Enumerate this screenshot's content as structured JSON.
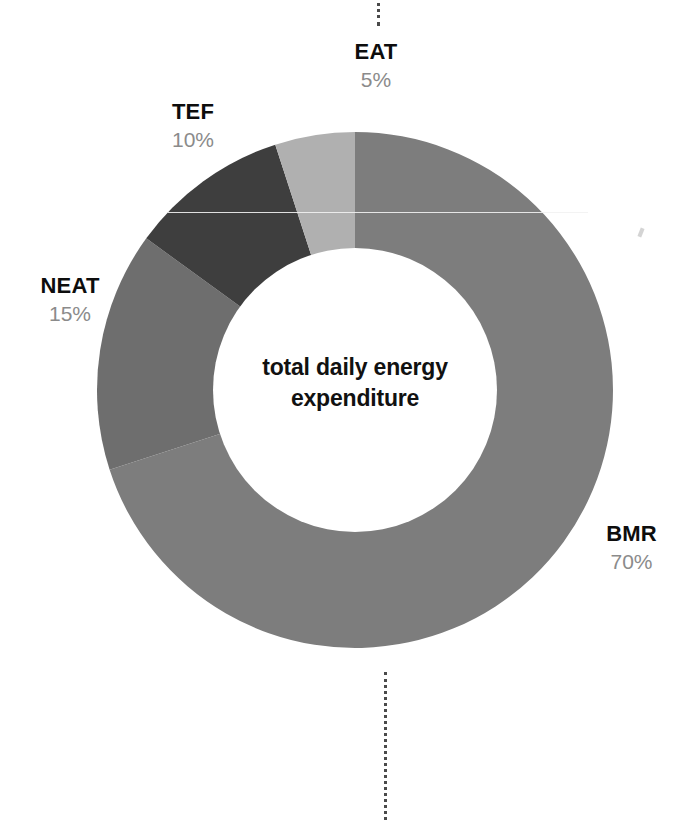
{
  "figure": {
    "center_caption_line1": "total daily energy",
    "center_caption_line2": "expenditure",
    "background_color": "#ffffff"
  },
  "labels": {
    "eat": {
      "name": "EAT",
      "pct": "5%"
    },
    "tef": {
      "name": "TEF",
      "pct": "10%"
    },
    "neat": {
      "name": "NEAT",
      "pct": "15%"
    },
    "bmr": {
      "name": "BMR",
      "pct": "70%"
    }
  },
  "connectors": {
    "top_icon": "vertical-dotted-line",
    "bottom_icon": "vertical-dotted-line"
  },
  "chart_data": {
    "type": "pie",
    "variant": "donut",
    "title": "total daily energy expenditure",
    "xlabel": "",
    "ylabel": "",
    "legend": "slice-callouts",
    "grid": false,
    "units": "percent",
    "total": 100,
    "start_angle_deg": 0,
    "direction": "clockwise",
    "inner_radius_ratio": 0.55,
    "categories": [
      "BMR",
      "NEAT",
      "TEF",
      "EAT"
    ],
    "values": [
      70,
      15,
      10,
      5
    ],
    "labels": [
      "70%",
      "15%",
      "10%",
      "5%"
    ],
    "colors": [
      "#7d7d7d",
      "#6e6e6e",
      "#3e3e3e",
      "#b0b0b0"
    ],
    "slices": [
      {
        "name": "BMR",
        "value": 70,
        "label": "70%",
        "color": "#7d7d7d",
        "start_deg": 0,
        "end_deg": 252
      },
      {
        "name": "NEAT",
        "value": 15,
        "label": "15%",
        "color": "#6e6e6e",
        "start_deg": 252,
        "end_deg": 306
      },
      {
        "name": "TEF",
        "value": 10,
        "label": "10%",
        "color": "#3e3e3e",
        "start_deg": 306,
        "end_deg": 342
      },
      {
        "name": "EAT",
        "value": 5,
        "label": "5%",
        "color": "#b0b0b0",
        "start_deg": 342,
        "end_deg": 360
      }
    ]
  }
}
